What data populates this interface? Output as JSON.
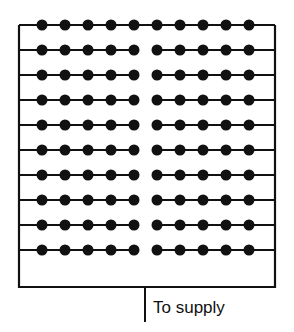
{
  "diagram": {
    "type": "parallel-wiring-grid",
    "rows": 10,
    "lamps_per_row_left": 5,
    "lamps_per_row_right": 5,
    "supply_label": "To supply",
    "colors": {
      "line": "#111111",
      "node": "#111111",
      "background": "#ffffff"
    },
    "frame": {
      "left": 19,
      "top": 25,
      "right": 275,
      "bottom": 287
    },
    "row_y": [
      25,
      50,
      75,
      100,
      125,
      150,
      175,
      200,
      225,
      250
    ],
    "left_dot_x": [
      42,
      65,
      88,
      111,
      134
    ],
    "right_dot_x": [
      157,
      180,
      203,
      226,
      249
    ],
    "supply_x": 145,
    "supply_bottom": 322
  }
}
